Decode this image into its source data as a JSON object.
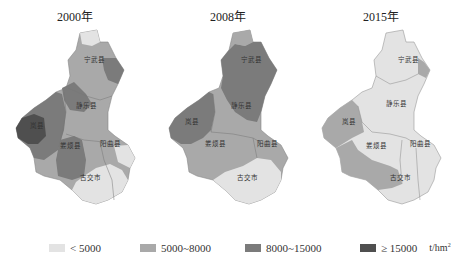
{
  "colors": {
    "lt5000": "#e3e3e3",
    "c5000_8000": "#a9a9a9",
    "c8000_15000": "#7b7b7b",
    "ge15000": "#4f4f4f",
    "boundary": "#666666"
  },
  "panels": [
    {
      "title": "2000年",
      "counties": {
        "ningwu": {
          "name": "宁武县",
          "class": "5000~8000",
          "note": "east patch 8000~15000, north tip <5000"
        },
        "jingle": {
          "name": "静乐县",
          "class": "5000~8000",
          "note": "northwest part 8000~15000"
        },
        "lanxian": {
          "name": "岚县",
          "class": "8000~15000",
          "note": "west part ≥15000"
        },
        "loufan": {
          "name": "娄烦县",
          "class": "8000~15000"
        },
        "yangqu": {
          "name": "阳曲县",
          "class": "5000~8000",
          "note": "east part <5000"
        },
        "gujiao": {
          "name": "古交市",
          "class": "<5000",
          "note": "north part 5000~8000"
        }
      }
    },
    {
      "title": "2008年",
      "counties": {
        "ningwu": {
          "name": "宁武县",
          "class": "8000~15000",
          "note": "north tip 5000~8000"
        },
        "jingle": {
          "name": "静乐县",
          "class": "8000~15000",
          "note": "west part 5000~8000"
        },
        "lanxian": {
          "name": "岚县",
          "class": "8000~15000"
        },
        "loufan": {
          "name": "娄烦县",
          "class": "5000~8000"
        },
        "yangqu": {
          "name": "阳曲县",
          "class": "5000~8000"
        },
        "gujiao": {
          "name": "古交市",
          "class": "<5000"
        }
      }
    },
    {
      "title": "2015年",
      "counties": {
        "ningwu": {
          "name": "宁武县",
          "class": "<5000",
          "note": "east patch 5000~8000"
        },
        "jingle": {
          "name": "静乐县",
          "class": "<5000"
        },
        "lanxian": {
          "name": "岚县",
          "class": "5000~8000"
        },
        "loufan": {
          "name": "娄烦县",
          "class": "<5000",
          "note": "south part 5000~8000"
        },
        "yangqu": {
          "name": "阳曲县",
          "class": "<5000"
        },
        "gujiao": {
          "name": "古交市",
          "class": "<5000"
        }
      }
    }
  ],
  "legend": {
    "items": [
      {
        "label": "< 5000",
        "color": "#e3e3e3"
      },
      {
        "label": "5000~8000",
        "color": "#a9a9a9"
      },
      {
        "label": "8000~15000",
        "color": "#7b7b7b"
      },
      {
        "label": "≥ 15000",
        "color": "#4f4f4f"
      }
    ],
    "unit": "t/hm",
    "unit_sup": "2"
  }
}
